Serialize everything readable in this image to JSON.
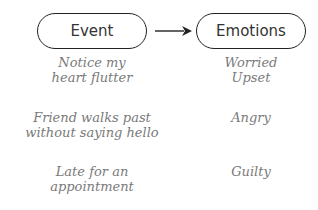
{
  "diagram": {
    "nodes": [
      {
        "id": "event",
        "label": "Event"
      },
      {
        "id": "emotions",
        "label": "Emotions"
      }
    ],
    "edge": {
      "from": "event",
      "to": "emotions",
      "type": "arrow"
    },
    "rows": [
      {
        "event_line1": "Notice my",
        "event_line2": "heart flutter",
        "emotion_line1": "Worried",
        "emotion_line2": "Upset"
      },
      {
        "event_line1": "Friend walks past",
        "event_line2": "without saying hello",
        "emotion_line1": "Angry",
        "emotion_line2": ""
      },
      {
        "event_line1": "Late for an",
        "event_line2": "appointment",
        "emotion_line1": "Guilty",
        "emotion_line2": ""
      }
    ]
  },
  "colors": {
    "outline": "#222222",
    "header_text": "#333333",
    "script_text": "#7a7a7a"
  }
}
